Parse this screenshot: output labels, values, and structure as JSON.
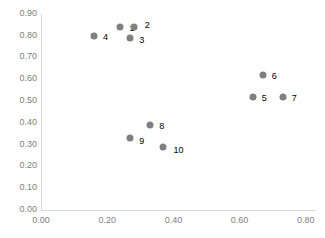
{
  "chart_data": {
    "type": "scatter",
    "title": "",
    "xlabel": "",
    "ylabel": "",
    "xlim": [
      0.0,
      0.8
    ],
    "ylim": [
      0.0,
      0.9
    ],
    "grid": false,
    "legend": "none",
    "x_ticks": [
      "0.00",
      "0.20",
      "0.40",
      "0.60",
      "0.80"
    ],
    "x_tick_values": [
      0.0,
      0.2,
      0.4,
      0.6,
      0.8
    ],
    "y_ticks": [
      "0.00",
      "0.10",
      "0.20",
      "0.30",
      "0.40",
      "0.50",
      "0.60",
      "0.70",
      "0.80",
      "0.90"
    ],
    "y_tick_values": [
      0.0,
      0.1,
      0.2,
      0.3,
      0.4,
      0.5,
      0.6,
      0.7,
      0.8,
      0.9
    ],
    "marker_color": "#808080",
    "axis_color": "#d9d9d9",
    "tick_label_color": "#808080",
    "point_label_color": "#000000",
    "points": [
      {
        "label": "1",
        "x": 0.24,
        "y": 0.84,
        "label_dx": 9,
        "label_dy": 1
      },
      {
        "label": "2",
        "x": 0.28,
        "y": 0.84,
        "label_dx": 11,
        "label_dy": -2
      },
      {
        "label": "3",
        "x": 0.27,
        "y": 0.79,
        "label_dx": 9,
        "label_dy": 2
      },
      {
        "label": "4",
        "x": 0.16,
        "y": 0.8,
        "label_dx": 9,
        "label_dy": 1
      },
      {
        "label": "5",
        "x": 0.64,
        "y": 0.52,
        "label_dx": 9,
        "label_dy": 1
      },
      {
        "label": "6",
        "x": 0.67,
        "y": 0.62,
        "label_dx": 9,
        "label_dy": 1
      },
      {
        "label": "7",
        "x": 0.73,
        "y": 0.52,
        "label_dx": 9,
        "label_dy": 1
      },
      {
        "label": "8",
        "x": 0.33,
        "y": 0.39,
        "label_dx": 9,
        "label_dy": 1
      },
      {
        "label": "9",
        "x": 0.27,
        "y": 0.33,
        "label_dx": 9,
        "label_dy": 3
      },
      {
        "label": "10",
        "x": 0.37,
        "y": 0.29,
        "label_dx": 10,
        "label_dy": 3
      }
    ]
  }
}
